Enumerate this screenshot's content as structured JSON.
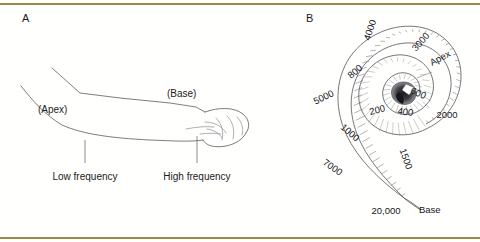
{
  "figure": {
    "background_color": "#fffffe",
    "rule_color": "#9a8a42",
    "ink_color": "#6e6e74"
  },
  "panel_a": {
    "letter": "A",
    "name": "arm-analogy-diagram",
    "inline_labels": [
      {
        "text": "(Apex)",
        "x": 60,
        "y": 113
      },
      {
        "text": "(Base)",
        "x": 193,
        "y": 97
      }
    ],
    "callouts": [
      {
        "text": "Low frequency",
        "x": 85,
        "y": 177,
        "leader_x": 85,
        "leader_y0": 140,
        "leader_y1": 163
      },
      {
        "text": "High frequency",
        "x": 197,
        "y": 177,
        "leader_x": 197,
        "leader_y0": 136,
        "leader_y1": 163
      }
    ]
  },
  "panel_b": {
    "letter": "B",
    "name": "cochlea-spiral-diagram",
    "anchor_labels": [
      {
        "text": "Apex",
        "x": 432,
        "y": 66,
        "rotation": -28
      },
      {
        "text": "Base",
        "x": 419,
        "y": 213,
        "rotation": 0
      }
    ],
    "frequency_labels": [
      {
        "text": "4000",
        "x": 373,
        "y": 31,
        "rotation": -72
      },
      {
        "text": "3000",
        "x": 423,
        "y": 44,
        "rotation": -48
      },
      {
        "text": "2000",
        "x": 447,
        "y": 118,
        "rotation": 0
      },
      {
        "text": "1500",
        "x": 403,
        "y": 160,
        "rotation": 70
      },
      {
        "text": "1000",
        "x": 348,
        "y": 135,
        "rotation": 40
      },
      {
        "text": "800",
        "x": 357,
        "y": 74,
        "rotation": -40
      },
      {
        "text": "600",
        "x": 417,
        "y": 96,
        "rotation": 25
      },
      {
        "text": "400",
        "x": 405,
        "y": 115,
        "rotation": 8
      },
      {
        "text": "200",
        "x": 378,
        "y": 113,
        "rotation": -14
      },
      {
        "text": "5000",
        "x": 325,
        "y": 100,
        "rotation": -26
      },
      {
        "text": "7000",
        "x": 331,
        "y": 170,
        "rotation": 34
      },
      {
        "text": "20,000",
        "x": 386,
        "y": 214,
        "rotation": 0
      }
    ]
  }
}
